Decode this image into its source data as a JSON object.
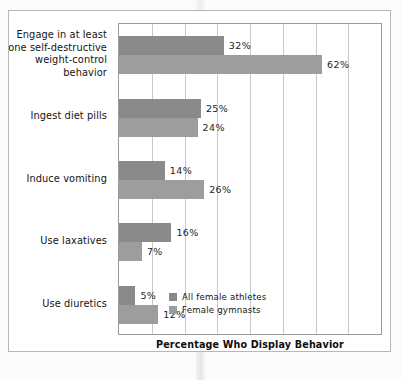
{
  "chart_data": {
    "type": "bar",
    "orientation": "horizontal",
    "title": "",
    "xlabel": "Percentage Who Display Behavior",
    "ylabel": "",
    "xlim": [
      0,
      80
    ],
    "xticks": [
      0,
      10,
      20,
      30,
      40,
      50,
      60,
      70,
      80
    ],
    "grid": "vertical",
    "legend_position": "inside-bottom-right",
    "value_suffix": "%",
    "categories": [
      "Engage in at least one self-destructive weight-control behavior",
      "Ingest diet pills",
      "Induce vomiting",
      "Use laxatives",
      "Use diuretics"
    ],
    "category_lines": [
      [
        "Engage in at least",
        "one self-destructive",
        "weight-control",
        "behavior"
      ],
      [
        "Ingest diet pills"
      ],
      [
        "Induce vomiting"
      ],
      [
        "Use laxatives"
      ],
      [
        "Use diuretics"
      ]
    ],
    "series": [
      {
        "name": "All female athletes",
        "color": "#8a8a8a",
        "values": [
          32,
          25,
          14,
          16,
          5
        ],
        "labels": [
          "32%",
          "25%",
          "14%",
          "16%",
          "5%"
        ]
      },
      {
        "name": "Female gymnasts",
        "color": "#9d9d9d",
        "values": [
          62,
          24,
          26,
          7,
          12
        ],
        "labels": [
          "62%",
          "24%",
          "26%",
          "7%",
          "12%"
        ]
      }
    ]
  },
  "legend": {
    "items": [
      {
        "label": "All female athletes",
        "color": "#8a8a8a"
      },
      {
        "label": "Female gymnasts",
        "color": "#9d9d9d"
      }
    ]
  },
  "axis": {
    "x_title": "Percentage Who Display Behavior"
  }
}
